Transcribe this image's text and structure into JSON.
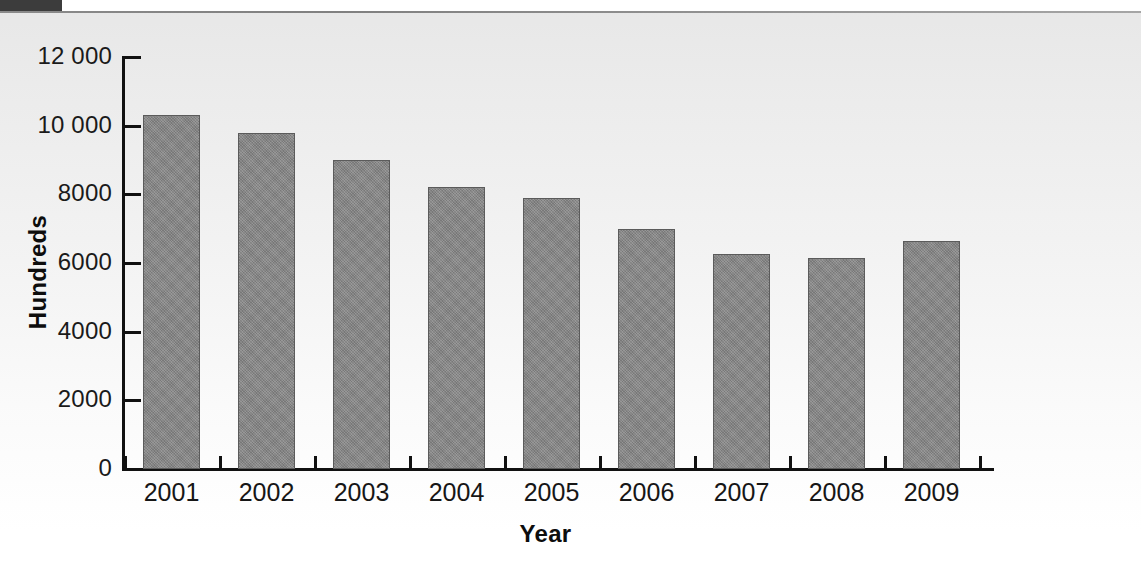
{
  "page": {
    "background_top": "#e7e7e7",
    "background_bottom": "#ffffff",
    "crop_block_color": "#3c3c3c"
  },
  "chart_data": {
    "type": "bar",
    "title": "",
    "xlabel": "Year",
    "ylabel": "Hundreds",
    "categories": [
      "2001",
      "2002",
      "2003",
      "2004",
      "2005",
      "2006",
      "2007",
      "2008",
      "2009"
    ],
    "values": [
      10300,
      9800,
      9000,
      8200,
      7900,
      7000,
      6250,
      6150,
      6650
    ],
    "ylim": [
      0,
      12000
    ],
    "ytick_values": [
      0,
      2000,
      4000,
      6000,
      8000,
      10000,
      12000
    ],
    "ytick_labels": [
      "0",
      "2000",
      "4000",
      "6000",
      "8000",
      "10 000",
      "12 000"
    ],
    "grid": false,
    "legend": null,
    "bar_color": "#838383",
    "bar_border_color": "#5b5b5b",
    "axis_color": "#111111"
  }
}
